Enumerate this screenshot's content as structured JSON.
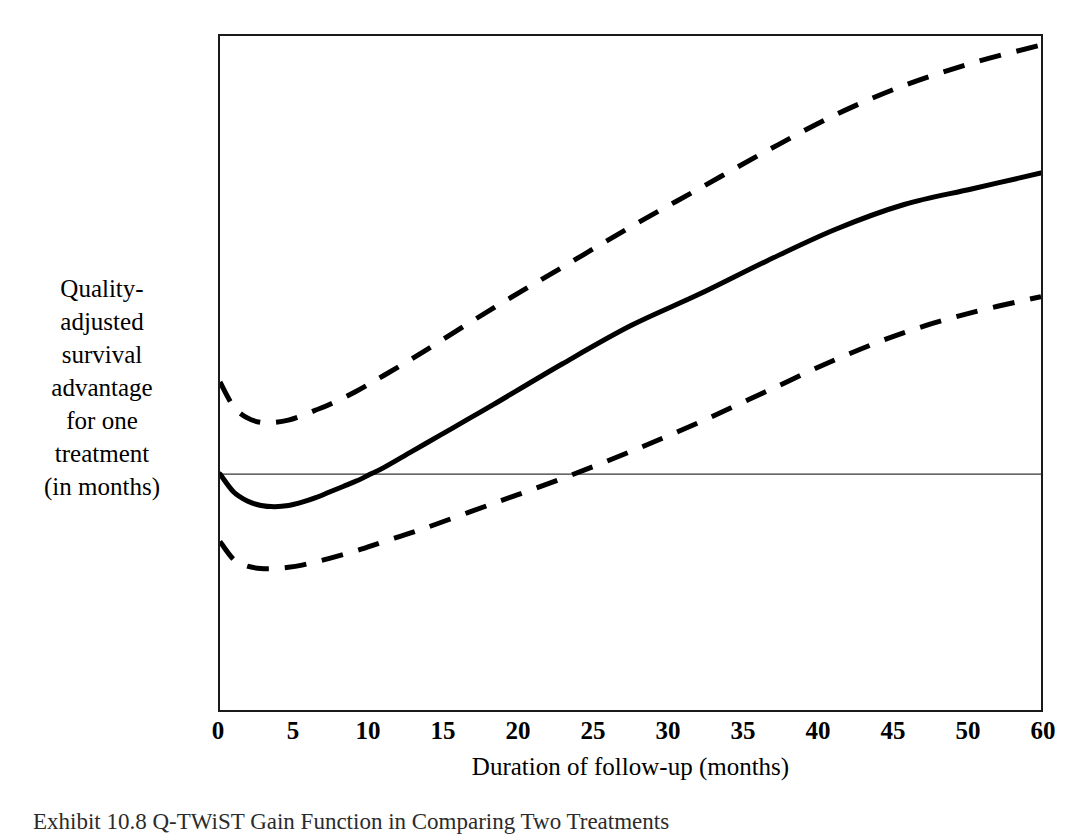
{
  "figure": {
    "caption": "Exhibit 10.8  Q-TWiST Gain Function in Comparing Two Treatments",
    "background_color": "#ffffff",
    "line_color": "#000000"
  },
  "chart_data": {
    "type": "line",
    "title": "",
    "subtitle": "",
    "xlabel": "Duration of follow-up (months)",
    "ylabel": "Quality-adjusted\nsurvival\nadvantage\nfor one\ntreatment\n(in months)",
    "ylabel_lines": [
      "Quality-",
      "adjusted",
      "survival",
      "advantage",
      "for one",
      "treatment",
      "(in months)"
    ],
    "xlim": [
      0,
      60
    ],
    "ylim": [
      -10,
      20
    ],
    "xticks": [
      0,
      5,
      10,
      15,
      20,
      25,
      30,
      35,
      40,
      45,
      50,
      60
    ],
    "xtick_labels": [
      "0",
      "5",
      "10",
      "15",
      "20",
      "25",
      "30",
      "35",
      "40",
      "45",
      "50",
      "60"
    ],
    "yticks": [
      20,
      15,
      10,
      5,
      0,
      -5,
      -10
    ],
    "ytick_labels": [
      "20",
      "15",
      "10",
      "5",
      "0",
      "-5",
      "-10"
    ],
    "grid": false,
    "legend": false,
    "legend_position": "none",
    "reference_lines": [
      {
        "name": "zero-reference-line",
        "orientation": "horizontal",
        "y": 0.5,
        "style": "solid",
        "width": 1
      }
    ],
    "series": [
      {
        "name": "Q-TWiST gain (point estimate)",
        "style": "solid",
        "width": 5,
        "color": "#000000",
        "x": [
          0,
          1,
          2,
          3,
          4,
          5,
          6,
          7,
          8,
          9,
          10,
          11,
          12,
          14,
          16,
          18,
          20,
          25,
          30,
          35,
          40,
          45,
          50,
          55,
          60
        ],
        "values": [
          0.5,
          -0.3,
          -0.7,
          -0.9,
          -0.95,
          -0.9,
          -0.75,
          -0.55,
          -0.3,
          -0.05,
          0.2,
          0.5,
          0.8,
          1.5,
          2.2,
          2.9,
          3.6,
          5.4,
          7.1,
          8.5,
          10.0,
          11.4,
          12.5,
          13.2,
          13.9
        ]
      },
      {
        "name": "Upper 95% confidence limit",
        "style": "dashed",
        "width": 5,
        "color": "#000000",
        "x": [
          0,
          1,
          2,
          3,
          4,
          5,
          6,
          7,
          8,
          10,
          12,
          15,
          20,
          25,
          30,
          35,
          40,
          45,
          50,
          55,
          60
        ],
        "values": [
          4.6,
          3.5,
          3.0,
          2.8,
          2.8,
          2.9,
          3.1,
          3.35,
          3.6,
          4.2,
          4.9,
          6.0,
          7.9,
          9.7,
          11.5,
          13.2,
          14.9,
          16.5,
          17.8,
          18.8,
          19.6
        ]
      },
      {
        "name": "Lower 95% confidence limit",
        "style": "dashed",
        "width": 5,
        "color": "#000000",
        "x": [
          0,
          1,
          2,
          3,
          4,
          5,
          6,
          7,
          8,
          10,
          12,
          15,
          20,
          25,
          30,
          35,
          40,
          45,
          50,
          55,
          60
        ],
        "values": [
          -2.5,
          -3.3,
          -3.6,
          -3.7,
          -3.7,
          -3.65,
          -3.55,
          -3.4,
          -3.25,
          -2.9,
          -2.5,
          -1.9,
          -0.8,
          0.3,
          1.5,
          2.8,
          4.2,
          5.6,
          6.8,
          7.7,
          8.4
        ]
      }
    ],
    "annotations": []
  }
}
